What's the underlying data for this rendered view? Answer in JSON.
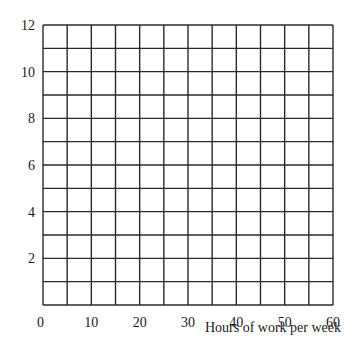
{
  "chart_data": {
    "type": "line",
    "title": "",
    "xlabel": "Hours of work per week",
    "ylabel": "",
    "xlim": [
      0,
      60
    ],
    "ylim": [
      0,
      12
    ],
    "x_ticks": [
      0,
      10,
      20,
      30,
      40,
      50,
      60
    ],
    "y_ticks": [
      2,
      4,
      6,
      8,
      10,
      12
    ],
    "x_grid_step": 5,
    "y_grid_step": 1,
    "grid": true,
    "series": [],
    "legend": null
  },
  "colors": {
    "grid": "#2a2a2a",
    "text": "#1a1a1a",
    "background": "#ffffff"
  }
}
